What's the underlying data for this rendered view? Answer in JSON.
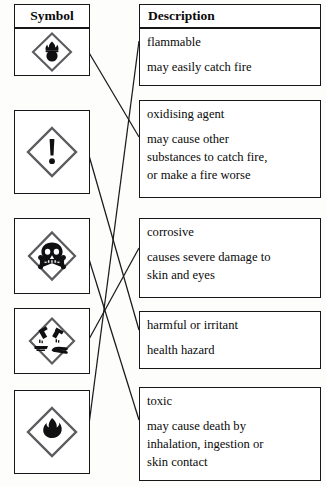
{
  "headers": {
    "symbol": "Symbol",
    "description": "Description"
  },
  "colors": {
    "ink": "#17171a",
    "paper": "#fdfdfc",
    "line": "#1a1a1a"
  },
  "symbols": [
    {
      "id": "symbol-1",
      "icon": "oxidising-flame-over-circle-icon",
      "alt": "flame over circle in diamond"
    },
    {
      "id": "symbol-2",
      "icon": "exclamation-mark-icon",
      "alt": "exclamation mark in diamond"
    },
    {
      "id": "symbol-3",
      "icon": "skull-and-crossbones-icon",
      "alt": "skull and crossbones in diamond"
    },
    {
      "id": "symbol-4",
      "icon": "corrosive-icon",
      "alt": "corrosive liquid on hand and surface in diamond"
    },
    {
      "id": "symbol-5",
      "icon": "flame-icon",
      "alt": "flame in diamond"
    }
  ],
  "descriptions": [
    {
      "id": "description-1",
      "heading": "flammable",
      "lines": [
        "may easily catch fire"
      ]
    },
    {
      "id": "description-2",
      "heading": "oxidising agent",
      "lines": [
        "may cause other",
        "substances to catch fire,",
        "or make a fire worse"
      ]
    },
    {
      "id": "description-3",
      "heading": "corrosive",
      "lines": [
        "causes severe damage to",
        "skin and eyes"
      ]
    },
    {
      "id": "description-4",
      "heading": "harmful or irritant",
      "lines": [
        "health hazard"
      ]
    },
    {
      "id": "description-5",
      "heading": "toxic",
      "lines": [
        "may cause death by",
        "inhalation, ingestion or",
        "skin contact"
      ]
    }
  ],
  "connections": [
    {
      "id": "connector-1",
      "from": "symbol-1",
      "to": "description-2"
    },
    {
      "id": "connector-2",
      "from": "symbol-2",
      "to": "description-4"
    },
    {
      "id": "connector-3",
      "from": "symbol-3",
      "to": "description-5"
    },
    {
      "id": "connector-4",
      "from": "symbol-4",
      "to": "description-3"
    },
    {
      "id": "connector-5",
      "from": "symbol-5",
      "to": "description-1"
    }
  ]
}
